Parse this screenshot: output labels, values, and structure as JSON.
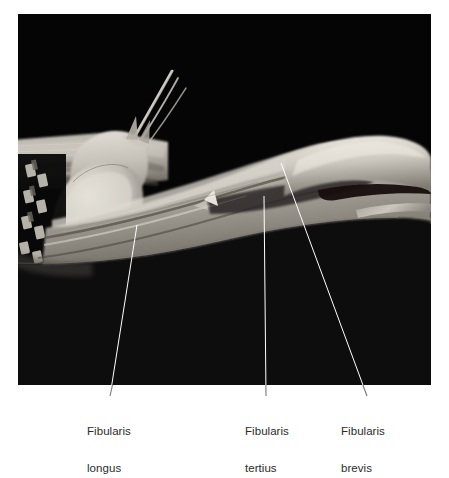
{
  "figure": {
    "type": "anatomical-dissection-photograph",
    "background_color": "#ffffff",
    "photo": {
      "name": "cadaveric-dissection-photo",
      "description": "Grayscale cadaveric dissection of the lateral lower leg and ankle on a black background, showing the fibularis longus, fibularis brevis and fibularis tertius muscles with their tendons.",
      "frame": {
        "x": 18,
        "y": 14,
        "width": 413,
        "height": 371
      },
      "background_color": "#050505",
      "tissue_light": "#d8d4cc",
      "tissue_mid": "#9a958d",
      "tissue_dark": "#4e4a45",
      "instrument_color": "#111111"
    },
    "leader_line_color": "#ffffff",
    "leader_line_color_outside": "#6f6f6f",
    "leader_line_width": 1
  },
  "labels": [
    {
      "name": "fibularis-longus",
      "line1": "Fibularis",
      "line2": "longus",
      "text_x": 87,
      "text_y": 400,
      "leader": {
        "x1": 137,
        "y1": 225,
        "x2": 110,
        "y2": 396
      }
    },
    {
      "name": "fibularis-tertius",
      "line1": "Fibularis",
      "line2": "tertius",
      "text_x": 245,
      "text_y": 400,
      "leader": {
        "x1": 264,
        "y1": 196,
        "x2": 266,
        "y2": 396
      }
    },
    {
      "name": "fibularis-brevis",
      "line1": "Fibularis",
      "line2": "brevis",
      "text_x": 341,
      "text_y": 400,
      "leader": {
        "x1": 281,
        "y1": 163,
        "x2": 367,
        "y2": 396
      }
    }
  ],
  "text_color": "#2b2b2b"
}
